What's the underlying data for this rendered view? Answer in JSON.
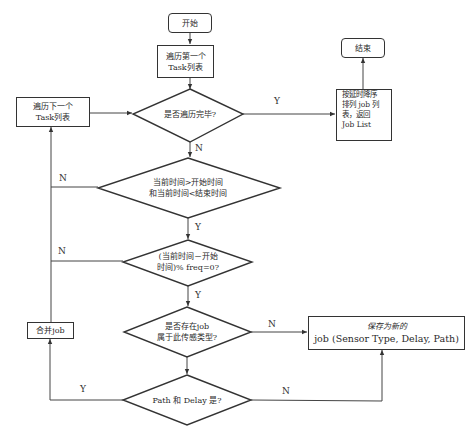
{
  "nodes": {
    "start": "开始",
    "traverse_first_line1": "遍历第一个",
    "traverse_first_line2": "Task列表",
    "all_traversed": "是否遍历完毕?",
    "end": "结束",
    "sort_line1": "按延时降序",
    "sort_line2": "排列 job 列",
    "sort_line3": "表，返回",
    "sort_line4": "Job List",
    "traverse_next_line1": "遍历下一个",
    "traverse_next_line2": "Task列表",
    "time_window_line1": "当前时间>开始时间",
    "time_window_line2": "和当前时间<结束时间",
    "freq_check_line1": "(当前时间－开始",
    "freq_check_line2": "时间)% freq=0?",
    "job_exists_line1": "是否存在job",
    "job_exists_line2": "属于此传感类型?",
    "save_new_line1": "保存为新的",
    "save_new_line2": "job (Sensor Type, Delay, Path)",
    "merge_job": "合并job",
    "path_delay_check": "Path 和 Delay 是?"
  },
  "edge_labels": {
    "all_traversed_yes": "Y",
    "all_traversed_no": "N",
    "time_window_no": "N",
    "time_window_yes": "Y",
    "freq_check_no": "N",
    "freq_check_yes": "Y",
    "job_exists_no": "N",
    "path_delay_yes": "Y",
    "path_delay_no": "N"
  },
  "colors": {
    "stroke": "#333333",
    "background": "#ffffff"
  }
}
